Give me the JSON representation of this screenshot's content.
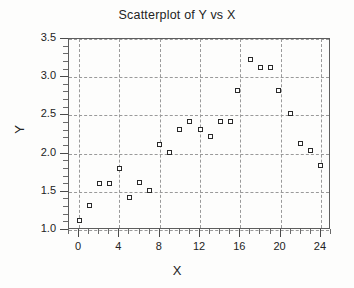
{
  "chart_data": {
    "type": "scatter",
    "title": "Scatterplot of Y vs X",
    "xlabel": "X",
    "ylabel": "Y",
    "xlim": [
      -1,
      25
    ],
    "ylim": [
      1.0,
      3.5
    ],
    "grid": true,
    "legend": null,
    "x_ticks": [
      0,
      4,
      8,
      12,
      16,
      20,
      24
    ],
    "x_tick_labels": [
      "0",
      "4",
      "8",
      "12",
      "16",
      "20",
      "24"
    ],
    "x_minor_tick_step": 1,
    "y_ticks": [
      1.0,
      1.5,
      2.0,
      2.5,
      3.0,
      3.5
    ],
    "y_tick_labels": [
      "1.0",
      "1.5",
      "2.0",
      "2.5",
      "3.0",
      "3.5"
    ],
    "y_minor_tick_step": 0.1,
    "marker": "open-square",
    "marker_color": "#2a2a2a",
    "x": [
      0,
      1,
      2,
      3,
      4,
      5,
      6,
      7,
      8,
      9,
      10,
      11,
      12,
      13,
      14,
      15,
      17,
      18,
      19,
      20,
      21,
      22,
      23,
      24
    ],
    "y": [
      1.12,
      1.32,
      1.61,
      1.61,
      1.81,
      1.42,
      1.62,
      1.52,
      2.12,
      2.02,
      2.32,
      2.42,
      2.32,
      2.22,
      2.42,
      2.42,
      3.23,
      3.13,
      3.13,
      2.83,
      2.53,
      2.13,
      2.04,
      1.85
    ],
    "points": [
      {
        "x": 0,
        "y": 1.12
      },
      {
        "x": 1,
        "y": 1.32
      },
      {
        "x": 2,
        "y": 1.61
      },
      {
        "x": 3,
        "y": 1.61
      },
      {
        "x": 4,
        "y": 1.81
      },
      {
        "x": 5,
        "y": 1.42
      },
      {
        "x": 6,
        "y": 1.62
      },
      {
        "x": 7,
        "y": 1.52
      },
      {
        "x": 8,
        "y": 2.12
      },
      {
        "x": 9,
        "y": 2.02
      },
      {
        "x": 10,
        "y": 2.32
      },
      {
        "x": 11,
        "y": 2.42
      },
      {
        "x": 12,
        "y": 2.32
      },
      {
        "x": 13,
        "y": 2.22
      },
      {
        "x": 14,
        "y": 2.42
      },
      {
        "x": 15,
        "y": 2.42
      },
      {
        "x": 15.7,
        "y": 2.83
      },
      {
        "x": 17,
        "y": 3.23
      },
      {
        "x": 18,
        "y": 3.13
      },
      {
        "x": 19,
        "y": 3.13
      },
      {
        "x": 19.8,
        "y": 2.83
      },
      {
        "x": 21,
        "y": 2.53
      },
      {
        "x": 22,
        "y": 2.13
      },
      {
        "x": 23,
        "y": 2.04
      },
      {
        "x": 24,
        "y": 1.85
      }
    ]
  },
  "colors": {
    "frame": "#5d5d5d",
    "grid": "#9a9a9a",
    "text": "#232323",
    "marker_edge": "#2a2a2a",
    "background": "#fdfdfc"
  }
}
